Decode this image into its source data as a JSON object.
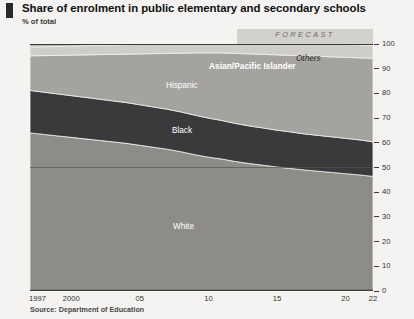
{
  "header": {
    "title": "Share of enrolment in public elementary and secondary schools",
    "subtitle": "% of total",
    "marker_color": "#2b2b2b"
  },
  "forecast": {
    "label": "FORECAST",
    "start_year": 2012,
    "band_color": "#d3d1cc"
  },
  "source": "Source: Department of Education",
  "axis": {
    "y_ticks": [
      "0",
      "10",
      "20",
      "30",
      "40",
      "50",
      "60",
      "70",
      "80",
      "90",
      "100"
    ],
    "x_ticks": [
      "1997",
      "2000",
      "05",
      "10",
      "15",
      "20",
      "22"
    ]
  },
  "series_labels": [
    {
      "name": "Others",
      "style": "dark"
    },
    {
      "name": "Asian/Pacific Islander",
      "style": "bold"
    },
    {
      "name": "Hispanic",
      "style": "light"
    },
    {
      "name": "Black",
      "style": "light"
    },
    {
      "name": "White",
      "style": "light"
    }
  ],
  "chart_data": {
    "type": "area",
    "title": "Share of enrolment in public elementary and secondary schools",
    "subtitle": "% of total",
    "xlabel": "",
    "ylabel": "% of total",
    "ylim": [
      0,
      100
    ],
    "xlim": [
      1997,
      2022
    ],
    "stacked": true,
    "grid": false,
    "gridline_at": 50,
    "legend": "inline-labels",
    "forecast_from": 2012,
    "source": "Source: Department of Education",
    "x": [
      1997,
      1998,
      1999,
      2000,
      2001,
      2002,
      2003,
      2004,
      2005,
      2006,
      2007,
      2008,
      2009,
      2010,
      2011,
      2012,
      2013,
      2014,
      2015,
      2016,
      2017,
      2018,
      2019,
      2020,
      2021,
      2022
    ],
    "series": [
      {
        "name": "White",
        "color": "#8e8c88",
        "values": [
          64.0,
          63.4,
          62.8,
          62.2,
          61.6,
          61.0,
          60.4,
          59.8,
          59.0,
          58.2,
          57.4,
          56.4,
          55.2,
          54.2,
          53.4,
          52.4,
          51.6,
          50.9,
          50.2,
          49.6,
          49.0,
          48.5,
          48.0,
          47.5,
          47.0,
          46.4
        ]
      },
      {
        "name": "Black",
        "color": "#3a3a3c",
        "values": [
          17.2,
          17.1,
          17.0,
          16.9,
          16.8,
          16.7,
          16.6,
          16.5,
          16.4,
          16.3,
          16.2,
          16.1,
          16.0,
          15.8,
          15.6,
          15.4,
          15.2,
          15.1,
          14.9,
          14.8,
          14.6,
          14.5,
          14.4,
          14.3,
          14.2,
          14.0
        ]
      },
      {
        "name": "Hispanic",
        "color": "#a5a3a0",
        "values": [
          14.0,
          14.8,
          15.6,
          16.4,
          17.2,
          18.0,
          18.8,
          19.6,
          20.6,
          21.6,
          22.6,
          23.8,
          25.2,
          26.4,
          27.4,
          28.4,
          29.2,
          29.8,
          30.5,
          31.0,
          31.6,
          32.0,
          32.4,
          32.8,
          33.2,
          33.8
        ]
      },
      {
        "name": "Asian/Pacific Islander",
        "color": "#cecdc9",
        "values": [
          3.6,
          3.6,
          3.6,
          3.6,
          3.7,
          3.7,
          3.8,
          3.8,
          3.9,
          3.9,
          4.0,
          4.0,
          4.1,
          4.2,
          4.3,
          4.4,
          4.5,
          4.6,
          4.7,
          4.8,
          4.9,
          5.0,
          5.1,
          5.2,
          5.3,
          5.4
        ]
      },
      {
        "name": "Others",
        "color": "#b7b5b1",
        "values": [
          1.2,
          1.1,
          1.0,
          0.9,
          0.7,
          0.6,
          0.4,
          0.3,
          0.1,
          0.0,
          0.0,
          0.0,
          0.0,
          0.0,
          0.0,
          0.0,
          0.0,
          0.0,
          0.0,
          0.0,
          0.0,
          0.0,
          0.0,
          0.0,
          0.0,
          0.0
        ]
      }
    ]
  }
}
